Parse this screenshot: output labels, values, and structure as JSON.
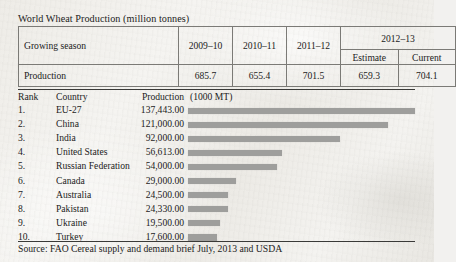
{
  "caption": "World Wheat Production (million tonnes)",
  "top_table": {
    "row_label_header": "Growing season",
    "season_columns": [
      "2009–10",
      "2010–11",
      "2011–12"
    ],
    "grouped_column": "2012–13",
    "grouped_subcolumns": [
      "Estimate",
      "Current"
    ],
    "data_row_label": "Production",
    "data_row_values": [
      "685.7",
      "655.4",
      "701.5",
      "659.3",
      "704.1"
    ]
  },
  "ranking": {
    "headers": {
      "rank": "Rank",
      "country": "Country",
      "production": "Production",
      "unit": "(1000 MT)"
    },
    "rows": [
      {
        "rank": "1.",
        "country": "EU-27",
        "production": "137,443.00",
        "value": 137443
      },
      {
        "rank": "2.",
        "country": "China",
        "production": "121,000.00",
        "value": 121000
      },
      {
        "rank": "3.",
        "country": "India",
        "production": "92,000.00",
        "value": 92000
      },
      {
        "rank": "4.",
        "country": "United States",
        "production": "56,613.00",
        "value": 56613
      },
      {
        "rank": "5.",
        "country": "Russian Federation",
        "production": "54,000.00",
        "value": 54000
      },
      {
        "rank": "6.",
        "country": "Canada",
        "production": "29,000.00",
        "value": 29000
      },
      {
        "rank": "7.",
        "country": "Australia",
        "production": "24,500.00",
        "value": 24500
      },
      {
        "rank": "8.",
        "country": "Pakistan",
        "production": "24,330.00",
        "value": 24330
      },
      {
        "rank": "9.",
        "country": "Ukraine",
        "production": "19,500.00",
        "value": 19500
      },
      {
        "rank": "10.",
        "country": "Turkey",
        "production": "17,600.00",
        "value": 17600
      }
    ]
  },
  "source": "Source: FAO Cereal supply and demand brief July, 2013 and USDA",
  "colors": {
    "bar": "#9e9e9c",
    "rule": "#3a3a38",
    "table_border": "#7b7a76",
    "text": "#1c1c1c",
    "paper": "#f2f1ef"
  },
  "chart_data": {
    "type": "bar",
    "xlabel": "Production (1000 MT)",
    "ylabel": "Country",
    "orientation": "horizontal",
    "grid": false,
    "legend": null,
    "xlim": [
      0,
      137443
    ],
    "categories": [
      "EU-27",
      "China",
      "India",
      "United States",
      "Russian Federation",
      "Canada",
      "Australia",
      "Pakistan",
      "Ukraine",
      "Turkey"
    ],
    "values": [
      137443,
      121000,
      92000,
      56613,
      54000,
      29000,
      24500,
      24330,
      19500,
      17600
    ],
    "units": "1000 MT"
  }
}
